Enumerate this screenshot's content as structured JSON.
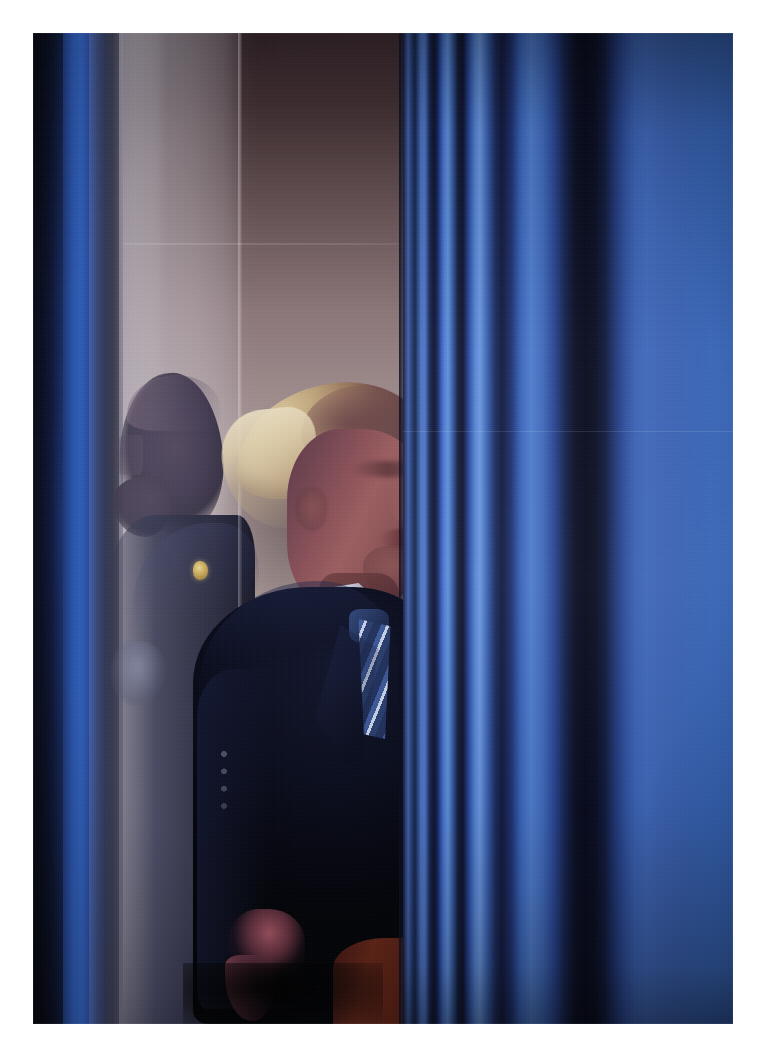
{
  "page": {
    "background_color": "#ffffff",
    "width": 766,
    "height": 1058,
    "type": "photograph"
  },
  "photo": {
    "frame": {
      "left": 33,
      "top": 33,
      "width": 700,
      "height": 991
    },
    "description": "Man in a dark navy suit with white shirt and blue striped tie, seen in profile from the side, walking to the right past heavy blue pleated curtains; his mirrored reflection appears in a glass panel to the left.",
    "palette": {
      "paper_white": "#ffffff",
      "curtain_bright_blue": "#4f7dcd",
      "curtain_mid_blue": "#3763b5",
      "curtain_shadow_navy": "#0b0f26",
      "wall_warm_light": "#c0b2ad",
      "wall_dark_mauve": "#2a1d22",
      "suit_black_navy": "#05060f",
      "shirt_white": "#e2e6f2",
      "tie_blue": "#3f5c9c",
      "hair_blonde": "#e8dcc0",
      "skin_shadow": "#9c5f60",
      "carpet_red_brown": "#5a2216",
      "lapel_pin_gold": "#c9a445"
    },
    "regions": {
      "left_curtain_edge": "dark navy curtain strip along the left border",
      "glass_column": "translucent glass / mirror panel holding the reflection",
      "reflection": "mirrored silhouette of the same man facing the opposite direction",
      "wall": "warm mauve-grey wall, dark at the top, lighter toward the floor",
      "cast_shadow": "soft head-and-shoulder shadow cast on the wall",
      "figure": "main subject in profile facing right",
      "floor": "dark red-brown carpet visible at the lower right of the figure",
      "right_curtain": "broad blue pleated curtain filling the right half"
    },
    "figure_parts": {
      "hair": "swept blonde-grey hair",
      "face": "profile of nose, lips and chin",
      "collar": "white shirt collar",
      "tie": "diagonally striped blue tie",
      "suit": "dark navy suit jacket",
      "hand": "left hand lit at the lower edge of the jacket",
      "lapel_pin": "small gold lapel pin on the reflected figure"
    }
  }
}
